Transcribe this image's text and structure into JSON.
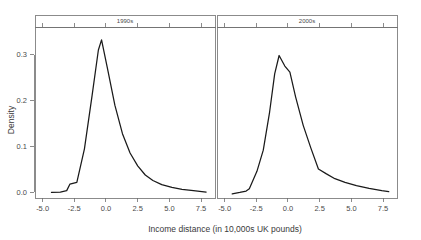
{
  "chart_data": {
    "type": "line",
    "title": "",
    "subtitle": "",
    "xlabel": "Income distance (in 10,000s UK pounds)",
    "ylabel": "Density",
    "xlim": [
      -5.6,
      8.6
    ],
    "ylim": [
      -0.012,
      0.36
    ],
    "xticks": [
      -5.0,
      -2.5,
      0.0,
      2.5,
      5.0,
      7.5
    ],
    "xticklabels": [
      "-5.0",
      "-2.5",
      "0.0",
      "2.5",
      "5.0",
      "7.5"
    ],
    "yticks": [
      0.0,
      0.1,
      0.2,
      0.3
    ],
    "yticklabels": [
      "0.0",
      "0.1",
      "0.2",
      "0.3"
    ],
    "grid": false,
    "legend": "none",
    "facet_layout": "1x2",
    "line_color": "#1a1a1a",
    "axis_color": "#6e6e6e",
    "panels": [
      {
        "label": "1990s",
        "series_name": "density-1990s",
        "x": [
          -4.3,
          -3.6,
          -3.1,
          -2.85,
          -2.3,
          -1.7,
          -1.1,
          -0.6,
          -0.35,
          0.1,
          0.7,
          1.3,
          1.9,
          2.5,
          3.1,
          3.7,
          4.4,
          5.2,
          6.0,
          6.9,
          7.9
        ],
        "y": [
          0.0,
          0.001,
          0.004,
          0.018,
          0.022,
          0.095,
          0.21,
          0.31,
          0.332,
          0.272,
          0.19,
          0.128,
          0.086,
          0.058,
          0.038,
          0.026,
          0.017,
          0.011,
          0.007,
          0.004,
          0.001
        ]
      },
      {
        "label": "2000s",
        "series_name": "density-2000s",
        "x": [
          -4.4,
          -3.8,
          -3.3,
          -3.05,
          -2.45,
          -1.95,
          -1.45,
          -1.05,
          -0.7,
          -0.25,
          0.15,
          0.6,
          1.2,
          1.8,
          2.4,
          3.0,
          3.7,
          4.5,
          5.4,
          6.4,
          7.4,
          7.95
        ],
        "y": [
          -0.003,
          0.0,
          0.003,
          0.008,
          0.046,
          0.092,
          0.175,
          0.258,
          0.298,
          0.275,
          0.262,
          0.208,
          0.146,
          0.097,
          0.051,
          0.041,
          0.03,
          0.022,
          0.015,
          0.009,
          0.004,
          0.002
        ]
      }
    ]
  },
  "axes": {
    "ylabel": "Density",
    "xlabel": "Income distance (in 10,000s UK pounds)"
  }
}
